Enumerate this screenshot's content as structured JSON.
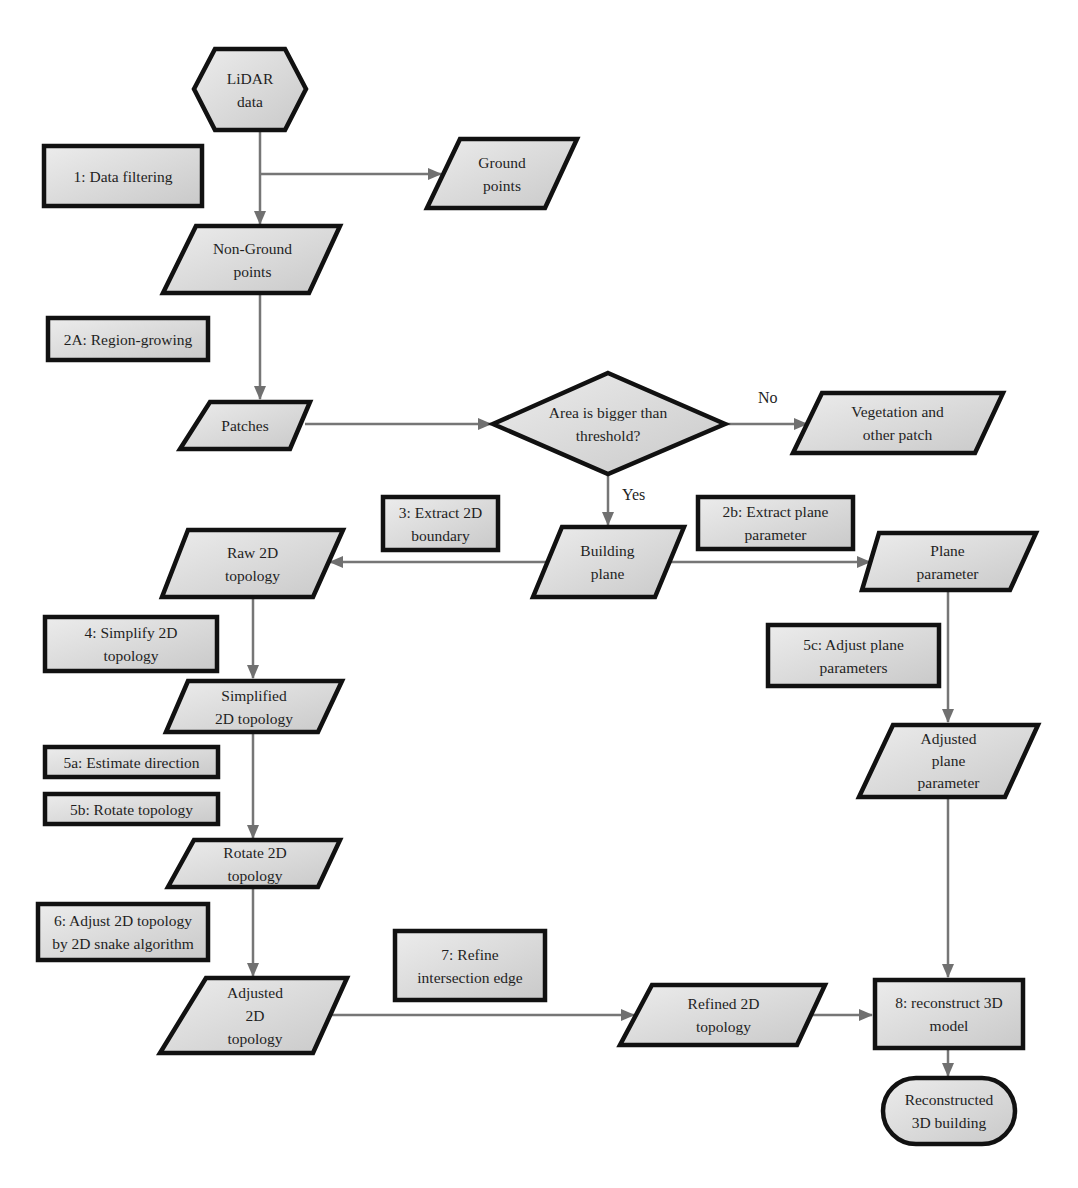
{
  "diagram": {
    "type": "flowchart",
    "colors": {
      "shape_fill_light": "#ececec",
      "shape_fill_dark": "#c9c9c9",
      "shape_stroke": "#111111",
      "arrow": "#707070",
      "text": "#1f1f1f"
    },
    "nodes": {
      "lidar": {
        "label": "LiDAR\ndata",
        "shape": "hexagon"
      },
      "step1": {
        "label": "1: Data filtering",
        "shape": "process-box"
      },
      "ground": {
        "label": "Ground\npoints",
        "shape": "parallelogram"
      },
      "nonground": {
        "label": "Non-Ground\npoints",
        "shape": "parallelogram"
      },
      "step2a": {
        "label": "2A: Region-growing",
        "shape": "process-box"
      },
      "patches": {
        "label": "Patches",
        "shape": "parallelogram"
      },
      "decision": {
        "label": "Area is bigger than\nthreshold?",
        "shape": "diamond"
      },
      "vegetation": {
        "label": "Vegetation and\nother patch",
        "shape": "parallelogram"
      },
      "step3": {
        "label": "3: Extract 2D\nboundary",
        "shape": "process-box"
      },
      "building": {
        "label": "Building\nplane",
        "shape": "parallelogram"
      },
      "step2b": {
        "label": "2b: Extract plane\nparameter",
        "shape": "process-box"
      },
      "raw2d": {
        "label": "Raw 2D\ntopology",
        "shape": "parallelogram"
      },
      "plane": {
        "label": "Plane\nparameter",
        "shape": "parallelogram"
      },
      "step4": {
        "label": "4: Simplify 2D\ntopology",
        "shape": "process-box"
      },
      "step5c": {
        "label": "5c: Adjust plane\nparameters",
        "shape": "process-box"
      },
      "simplified": {
        "label": "Simplified\n2D topology",
        "shape": "parallelogram"
      },
      "step5a": {
        "label": "5a: Estimate direction",
        "shape": "process-box"
      },
      "step5b": {
        "label": "5b: Rotate topology",
        "shape": "process-box"
      },
      "adjplane": {
        "label": "Adjusted\nplane\nparameter",
        "shape": "parallelogram"
      },
      "rotate2d": {
        "label": "Rotate 2D\ntopology",
        "shape": "parallelogram"
      },
      "step6": {
        "label": "6: Adjust 2D topology\nby 2D snake algorithm",
        "shape": "process-box"
      },
      "step7": {
        "label": "7: Refine\nintersection edge",
        "shape": "process-box"
      },
      "adjusted2d": {
        "label": "Adjusted\n2D\ntopology",
        "shape": "parallelogram"
      },
      "refined2d": {
        "label": "Refined 2D\ntopology",
        "shape": "parallelogram"
      },
      "step8": {
        "label": "8: reconstruct 3D\nmodel",
        "shape": "process-box"
      },
      "result": {
        "label": "Reconstructed\n3D building",
        "shape": "terminal"
      }
    },
    "edge_labels": {
      "no": "No",
      "yes": "Yes"
    },
    "edges": [
      {
        "from": "LiDAR data",
        "to": "Non-Ground points"
      },
      {
        "from": "LiDAR data",
        "to": "Ground points"
      },
      {
        "from": "Non-Ground points",
        "to": "Patches"
      },
      {
        "from": "Patches",
        "to": "Area is bigger than threshold?"
      },
      {
        "from": "Area is bigger than threshold?",
        "to": "Vegetation and other patch",
        "label": "No"
      },
      {
        "from": "Area is bigger than threshold?",
        "to": "Building plane",
        "label": "Yes"
      },
      {
        "from": "Building plane",
        "to": "Raw 2D topology"
      },
      {
        "from": "Building plane",
        "to": "Plane parameter"
      },
      {
        "from": "Raw 2D topology",
        "to": "Simplified 2D topology"
      },
      {
        "from": "Simplified 2D topology",
        "to": "Rotate 2D topology"
      },
      {
        "from": "Rotate 2D topology",
        "to": "Adjusted 2D topology"
      },
      {
        "from": "Adjusted 2D topology",
        "to": "Refined 2D topology"
      },
      {
        "from": "Refined 2D topology",
        "to": "8: reconstruct 3D model"
      },
      {
        "from": "Plane parameter",
        "to": "Adjusted plane parameter"
      },
      {
        "from": "Adjusted plane parameter",
        "to": "8: reconstruct 3D model"
      },
      {
        "from": "8: reconstruct 3D model",
        "to": "Reconstructed 3D building"
      }
    ]
  }
}
